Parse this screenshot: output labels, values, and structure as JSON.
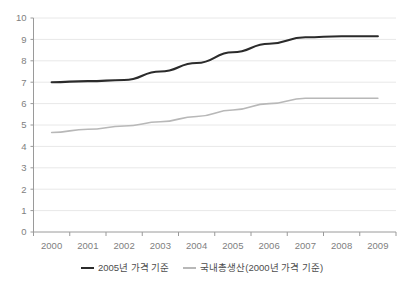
{
  "chart_data": {
    "type": "line",
    "title": "",
    "subtitle": "",
    "xlabel": "",
    "ylabel": "",
    "categories": [
      "2000",
      "2001",
      "2002",
      "2003",
      "2004",
      "2005",
      "2006",
      "2007",
      "2008",
      "2009"
    ],
    "ylim": [
      0,
      10
    ],
    "ytick_labels": [
      "0",
      "1",
      "2",
      "3",
      "4",
      "5",
      "6",
      "7",
      "8",
      "9",
      "10"
    ],
    "ytick_values": [
      0,
      1,
      2,
      3,
      4,
      5,
      6,
      7,
      8,
      9,
      10
    ],
    "grid": "horizontal",
    "legend_position": "bottom",
    "series": [
      {
        "name": "2005년 가격 기준",
        "color": "#2b2b2b",
        "values": [
          7.0,
          7.05,
          7.1,
          7.5,
          7.9,
          8.4,
          8.8,
          9.1,
          9.15,
          9.15
        ]
      },
      {
        "name": "국내총생산(2000년 가격 기준)",
        "color": "#b8b8b8",
        "values": [
          4.65,
          4.8,
          4.95,
          5.15,
          5.4,
          5.7,
          6.0,
          6.25,
          6.25,
          6.25
        ]
      }
    ]
  },
  "legend": {
    "items": [
      {
        "label": "2005년 가격 기준"
      },
      {
        "label": "국내총생산(2000년 가격 기준)"
      }
    ]
  },
  "colors": {
    "series_black": "#2b2b2b",
    "series_gray": "#b8b8b8",
    "gridline": "#e8e8e8",
    "axis": "#9a9a9a",
    "tick_text": "#808080",
    "background": "#ffffff"
  }
}
